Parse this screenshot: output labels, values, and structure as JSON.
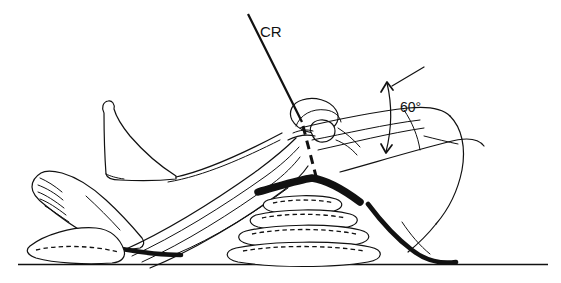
{
  "figure": {
    "kind": "radiographic-positioning-line-drawing",
    "background_color": "#ffffff",
    "ink_color": "#111111",
    "width": 561,
    "height": 283
  },
  "annotations": {
    "central_ray_label": "CR",
    "angle_label": "60°"
  },
  "elements": {
    "central_ray_solid_label": "central-ray-solid-line",
    "central_ray_dashed_label": "central-ray-dashed-extension",
    "angle_arc_label": "angle-arc-with-arrow",
    "table_line_label": "examination-table-surface",
    "sponge_stack_label": "sponge-support-stack",
    "heel_sponge_label": "heel-sponge-support",
    "near_leg_label": "near-leg-lateral-view",
    "far_leg_label": "far-leg-background",
    "knee_joint_label": "knee-joint-patella",
    "thigh_label": "flexed-thigh",
    "foot_label": "near-foot-with-toes"
  },
  "geometry": {
    "table_y": 264,
    "cr_entry_point": {
      "x": 302,
      "y": 122
    },
    "angle_vertex": {
      "x": 392,
      "y": 86
    },
    "angle_degrees": 60,
    "sponge_count": 4
  }
}
